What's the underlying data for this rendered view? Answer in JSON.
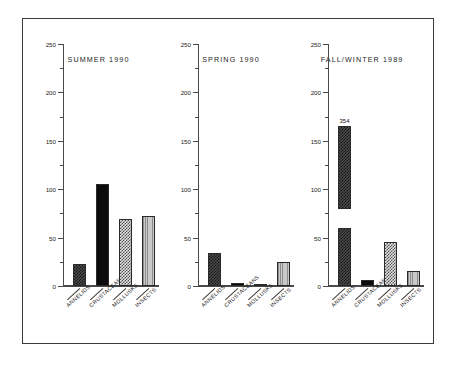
{
  "figure": {
    "categories": [
      "ANNELIDS",
      "CRUSTACEANS",
      "MOLLUSKS",
      "INSECTS"
    ],
    "y_axis": {
      "min": 0,
      "max": 250,
      "major_ticks": [
        0,
        50,
        100,
        150,
        200,
        250
      ],
      "minor_ticks": [
        25,
        75,
        125,
        175,
        225
      ],
      "tick_labels": [
        "0",
        "50",
        "100",
        "150",
        "200",
        "250"
      ]
    },
    "fills": [
      "dark-checker",
      "solid-black",
      "light-checker",
      "gray-vertical-lines"
    ]
  },
  "chart_data": {
    "type": "bar",
    "title": "",
    "xlabel": "",
    "ylabel": "",
    "ylim": [
      0,
      250
    ],
    "grid": false,
    "legend": "none",
    "categories": [
      "ANNELIDS",
      "CRUSTACEANS",
      "MOLLUSKS",
      "INSECTS"
    ],
    "panels": [
      {
        "title": "SUMMER 1990",
        "values": [
          23,
          105,
          69,
          72
        ],
        "labels": [
          "",
          "",
          "",
          ""
        ],
        "broken": [
          false,
          false,
          false,
          false
        ]
      },
      {
        "title": "SPRING 1990",
        "values": [
          34,
          3,
          1,
          25
        ],
        "labels": [
          "",
          "",
          "",
          ""
        ],
        "broken": [
          false,
          false,
          false,
          false
        ]
      },
      {
        "title": "FALL/WINTER 1989",
        "values": [
          354,
          6,
          45,
          16
        ],
        "labels": [
          "354",
          "",
          "",
          ""
        ],
        "broken": [
          true,
          false,
          false,
          false
        ],
        "break_note": "first bar axis-broken: lower segment 0-60, gap, upper segment 80-165 capped, true value 354"
      }
    ]
  }
}
